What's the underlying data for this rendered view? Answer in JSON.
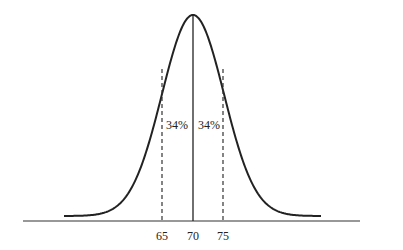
{
  "diagram": {
    "type": "normal-distribution-curve",
    "mean": 70,
    "std_dev": 5,
    "axis": {
      "ticks": [
        {
          "value": 65,
          "label": "65",
          "line": "dashed"
        },
        {
          "value": 70,
          "label": "70",
          "line": "solid"
        },
        {
          "value": 75,
          "label": "75",
          "line": "dashed"
        }
      ]
    },
    "regions": [
      {
        "from": 65,
        "to": 70,
        "label": "34%"
      },
      {
        "from": 70,
        "to": 75,
        "label": "34%"
      }
    ],
    "colors": {
      "curve": "#222222",
      "axis": "#333333",
      "background": "#ffffff"
    }
  }
}
